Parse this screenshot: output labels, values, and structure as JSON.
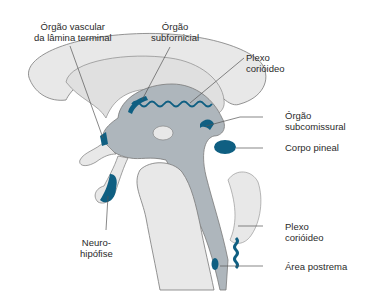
{
  "colors": {
    "tissue_light": "#e8e8e8",
    "ventricle": "#aeb6bc",
    "organ_blue": "#0f5f82",
    "outline": "#7a7a7a",
    "leader": "#555555"
  },
  "labels": {
    "ovlt": {
      "line1": "Órgão vascular",
      "line2": "da lâmina terminal"
    },
    "sfo": {
      "line1": "Órgão",
      "line2": "subfornicial"
    },
    "plexo_top": {
      "line1": "Plexo",
      "line2": "corióideo"
    },
    "sco": {
      "line1": "Órgão",
      "line2": "subcomissural"
    },
    "pineal": {
      "line1": "Corpo pineal"
    },
    "neuro": {
      "line1": "Neuro-",
      "line2": "hipófise"
    },
    "plexo_bottom": {
      "line1": "Plexo",
      "line2": "corióideo"
    },
    "area_postrema": {
      "line1": "Área postrema"
    }
  }
}
